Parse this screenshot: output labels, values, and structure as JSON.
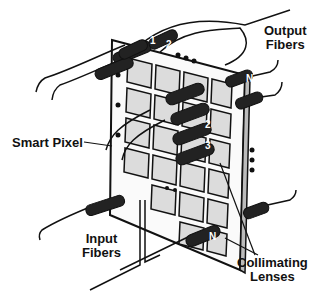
{
  "labels": {
    "output_fibers_line1": "Output",
    "output_fibers_line2": "Fibers",
    "smart_pixel": "Smart Pixel",
    "input_fibers_line1": "Input",
    "input_fibers_line2": "Fibers",
    "collimating_lenses_line1": "Collimating",
    "collimating_lenses_line2": "Lenses"
  },
  "lens_numbers": {
    "output_1": "1",
    "output_2": "2",
    "output_n": "N",
    "input_2": "2",
    "input_3": "3",
    "input_n": "N"
  },
  "colors": {
    "ink": "#111111",
    "paper": "#ffffff",
    "pixel_fill": "#d8d8d8"
  }
}
